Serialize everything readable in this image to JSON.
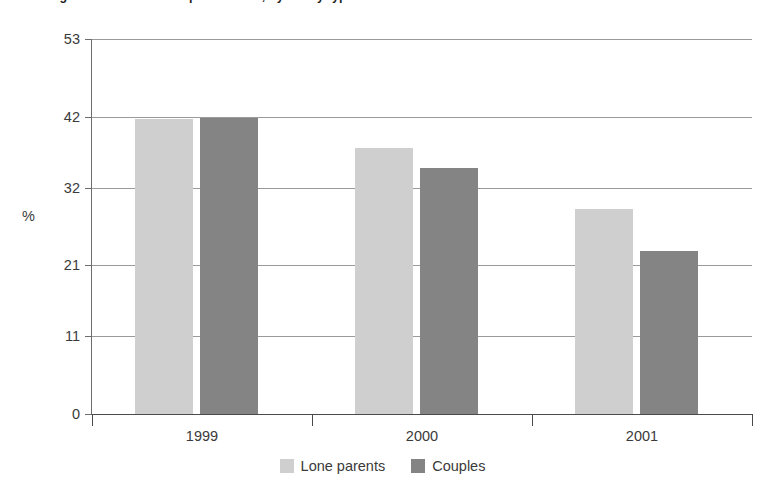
{
  "chart_data": {
    "type": "bar",
    "title": "Percentage of families in receipt of benefit, by family type",
    "xlabel": "",
    "ylabel": "%",
    "categories": [
      "1999",
      "2000",
      "2001"
    ],
    "series": [
      {
        "name": "Lone parents",
        "color": "#cfcfcf",
        "values": [
          41.7,
          37.6,
          29.0
        ]
      },
      {
        "name": "Couples",
        "color": "#848484",
        "values": [
          41.8,
          34.8,
          23.0
        ]
      }
    ],
    "ylim": [
      0,
      53
    ],
    "yticks": [
      "0",
      "11",
      "21",
      "32",
      "42",
      "53"
    ],
    "ytick_values": [
      0,
      11,
      21,
      32,
      42,
      53
    ],
    "grid": true,
    "grid_axis": "y",
    "legend_position": "bottom-center"
  },
  "axis": {
    "y_title": "%"
  },
  "legend": {
    "items": [
      {
        "label": "Lone parents"
      },
      {
        "label": "Couples"
      }
    ]
  }
}
